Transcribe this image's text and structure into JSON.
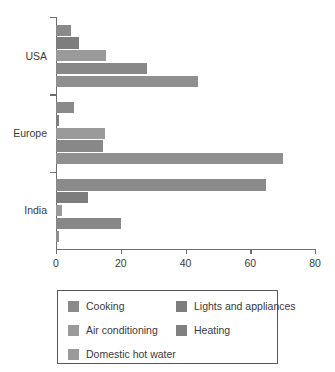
{
  "chart_data": {
    "type": "bar",
    "orientation": "horizontal",
    "title": "",
    "xlabel": "",
    "ylabel": "",
    "categories": [
      "USA",
      "Europe",
      "India"
    ],
    "xticks": [
      "0",
      "20",
      "40",
      "60",
      "80"
    ],
    "xlim": [
      0,
      80
    ],
    "grid": false,
    "legend_position": "bottom",
    "series": [
      {
        "name": "Cooking",
        "color": "#8a8a8a",
        "values": [
          4.5,
          5.5,
          65
        ]
      },
      {
        "name": "Lights and appliances",
        "color": "#7d7d7d",
        "values": [
          7,
          0.8,
          10
        ]
      },
      {
        "name": "Air conditioning",
        "color": "#9a9a9a",
        "values": [
          15.5,
          15,
          2
        ]
      },
      {
        "name": "Heating",
        "color": "#888888",
        "values": [
          28,
          14.5,
          20
        ]
      },
      {
        "name": "Domestic hot water",
        "color": "#8f8f8f",
        "values": [
          44,
          70,
          1
        ]
      }
    ]
  },
  "legend": {
    "columns": [
      [
        {
          "label": "Cooking",
          "swatch": "#8a8a8a"
        },
        {
          "label": "Air conditioning",
          "swatch": "#9a9a9a"
        },
        {
          "label": "Domestic hot water",
          "swatch": "#9a9a9a"
        }
      ],
      [
        {
          "label": "Lights and appliances",
          "swatch": "#7d7d7d"
        },
        {
          "label": "Heating",
          "swatch": "#808080"
        }
      ]
    ]
  },
  "colors": {
    "axis": "#6e6e6e",
    "text": "#3a3a3a",
    "legend_border": "#585858",
    "background": "#ffffff"
  }
}
